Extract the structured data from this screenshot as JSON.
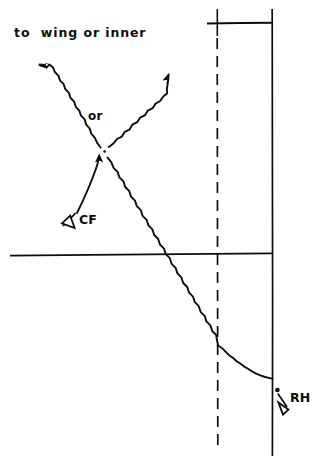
{
  "diagram": {
    "title_visible": false,
    "background_color": "#ffffff",
    "ink_color": "#0d0d0d",
    "width": 324,
    "height": 467,
    "labels": {
      "to_wing_or_inner": "to  wing or inner",
      "or": "or",
      "cf": "CF",
      "rh": "RH"
    },
    "markers": {
      "cf_pointer_icon": "hollow-triangle-arrowhead-icon",
      "rh_pointer_icon": "hollow-triangle-arrowhead-icon",
      "rh_point_icon": "dot-icon",
      "vertex_point_icon": "dot-icon"
    },
    "strokes": {
      "solid_vertical_rule": "solid",
      "dashed_vertical_rule": "dashed",
      "horizontal_rule": "solid",
      "top_tick": "solid",
      "branch_arrows": "wavy",
      "cf_arrow": "curved",
      "descending_ray": "wavy"
    }
  }
}
